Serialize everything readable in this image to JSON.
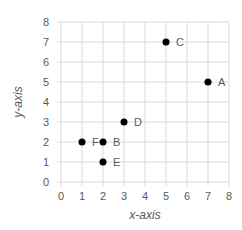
{
  "chart_data": {
    "type": "scatter",
    "title": "",
    "xlabel": "x-axis",
    "ylabel": "y-axis",
    "xlim": [
      0,
      8
    ],
    "ylim": [
      0,
      8
    ],
    "xticks": [
      "0",
      "1",
      "2",
      "3",
      "4",
      "5",
      "6",
      "7",
      "8"
    ],
    "yticks": [
      "0",
      "1",
      "2",
      "3",
      "4",
      "5",
      "6",
      "7",
      "8"
    ],
    "grid": true,
    "legend": null,
    "series": [
      {
        "name": "points",
        "color": "#000000",
        "points": [
          {
            "label": "A",
            "x": 7,
            "y": 5
          },
          {
            "label": "B",
            "x": 2,
            "y": 2
          },
          {
            "label": "C",
            "x": 5,
            "y": 7
          },
          {
            "label": "D",
            "x": 3,
            "y": 3
          },
          {
            "label": "E",
            "x": 2,
            "y": 1
          },
          {
            "label": "F",
            "x": 1,
            "y": 2
          }
        ]
      }
    ]
  },
  "colors": {
    "grid": "#d9d9d9",
    "text": "#595959",
    "marker": "#000000"
  }
}
